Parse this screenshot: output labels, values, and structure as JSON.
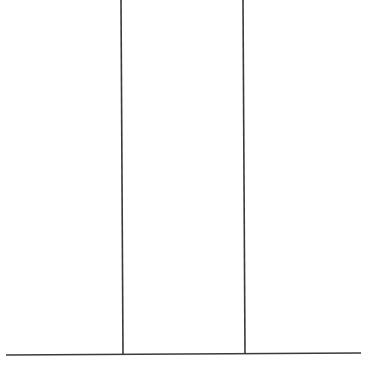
{
  "diagram": {
    "type": "line-drawing",
    "background": "#ffffff",
    "stroke_color": "#3a3a3a",
    "lines": [
      {
        "id": "vertical-left",
        "x1": 121,
        "y1": 0,
        "x2": 123,
        "y2": 355
      },
      {
        "id": "vertical-right",
        "x1": 243,
        "y1": 0,
        "x2": 245,
        "y2": 354
      },
      {
        "id": "baseline",
        "x1": 6,
        "y1": 355,
        "x2": 361,
        "y2": 353
      }
    ]
  }
}
